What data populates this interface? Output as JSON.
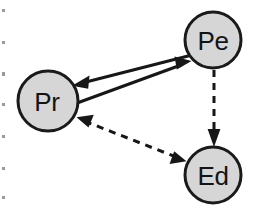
{
  "figure": {
    "background_color": "#ffffff",
    "width": 258,
    "height": 215
  },
  "style": {
    "node_fill": "#d6d6d6",
    "node_stroke": "#1a1a1a",
    "node_stroke_width": 3,
    "node_radius": 28,
    "label_color": "#141414",
    "label_font_size": 26,
    "edge_color": "#171717",
    "solid_edge_width": 3,
    "dashed_edge_width": 3,
    "dash_pattern": "7,6"
  },
  "nodes": [
    {
      "id": "Pe",
      "label": "Pe",
      "cx": 213,
      "cy": 40,
      "r": 28
    },
    {
      "id": "Pr",
      "label": "Pr",
      "cx": 48,
      "cy": 101,
      "r": 30
    },
    {
      "id": "Ed",
      "label": "Ed",
      "cx": 213,
      "cy": 175,
      "r": 28
    }
  ],
  "edges": [
    {
      "id": "pe-to-pr",
      "from": "Pe",
      "to": "Pr",
      "style": "solid",
      "arrowheads": "end",
      "x1": 190,
      "y1": 55,
      "x2": 74,
      "y2": 85
    },
    {
      "id": "pr-to-pe",
      "from": "Pr",
      "to": "Pe",
      "style": "solid",
      "arrowheads": "end",
      "x1": 73,
      "y1": 104,
      "x2": 190,
      "y2": 62
    },
    {
      "id": "pe-to-ed",
      "from": "Pe",
      "to": "Ed",
      "style": "dashed",
      "arrowheads": "end",
      "x1": 214,
      "y1": 70,
      "x2": 214,
      "y2": 146
    },
    {
      "id": "ed-to-pr",
      "from": "Ed",
      "to": "Pr",
      "style": "dashed",
      "arrowheads": "both",
      "x1": 186,
      "y1": 160,
      "x2": 76,
      "y2": 117
    }
  ],
  "margin_marks": {
    "description": "scan artifacts along left edge",
    "x": 3,
    "positions": [
      10,
      42,
      73,
      104,
      136,
      168,
      197
    ]
  }
}
